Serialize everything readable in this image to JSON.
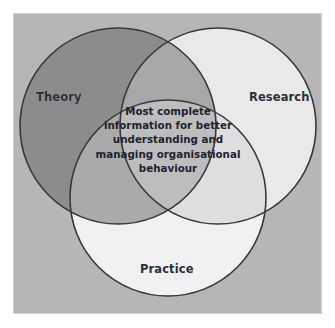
{
  "figure": {
    "type": "venn-diagram",
    "width": 335,
    "height": 328,
    "background_color": "#ffffff",
    "panel_color": "#b6b6b6",
    "panel_border_color": "#d2d2d2",
    "outline_color": "#3a3a3a",
    "text_color": "#2b2f3a"
  },
  "chart_data": {
    "type": "venn",
    "title": "",
    "sets": [
      {
        "id": "theory",
        "label": "Theory",
        "position": "top-left",
        "fill": "#8e8e8e",
        "center": {
          "x": 118,
          "y": 126
        },
        "radius": 98
      },
      {
        "id": "research",
        "label": "Research",
        "position": "top-right",
        "fill": "#e8e8e8",
        "center": {
          "x": 218,
          "y": 126
        },
        "radius": 98
      },
      {
        "id": "practice",
        "label": "Practice",
        "position": "bottom-center",
        "fill": "#f0f0f0",
        "center": {
          "x": 168,
          "y": 198
        },
        "radius": 98
      }
    ],
    "intersections": [
      {
        "sets": [
          "theory",
          "research",
          "practice"
        ],
        "label": "Most complete information for better understanding and managing organisational behaviour"
      }
    ]
  },
  "labels": {
    "theory": "Theory",
    "research": "Research",
    "practice": "Practice"
  },
  "center": {
    "text": "Most complete information for better understanding and managing organisational behaviour",
    "lines": [
      "Most complete",
      "information for better",
      "understanding and",
      "managing organisational",
      "behaviour"
    ]
  }
}
